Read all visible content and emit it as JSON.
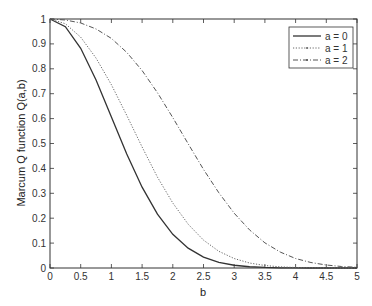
{
  "chart_data": {
    "type": "line",
    "title": "",
    "xlabel": "b",
    "ylabel": "Marcum Q function Q(a,b)",
    "xlim": [
      0,
      5
    ],
    "ylim": [
      0,
      1
    ],
    "grid": false,
    "legend_position": "upper right",
    "xticks": [
      "0",
      "0.5",
      "1",
      "1.5",
      "2",
      "2.5",
      "3",
      "3.5",
      "4",
      "4.5",
      "5"
    ],
    "yticks": [
      "0",
      "0.1",
      "0.2",
      "0.3",
      "0.4",
      "0.5",
      "0.6",
      "0.7",
      "0.8",
      "0.9",
      "1"
    ],
    "x": [
      0,
      0.25,
      0.5,
      0.75,
      1,
      1.25,
      1.5,
      1.75,
      2,
      2.25,
      2.5,
      2.75,
      3,
      3.25,
      3.5,
      3.75,
      4,
      4.25,
      4.5,
      4.75,
      5
    ],
    "series": [
      {
        "name": "a = 0",
        "style": "solid",
        "color": "#333333",
        "values": [
          1,
          0.969,
          0.8825,
          0.7548,
          0.6065,
          0.4578,
          0.3247,
          0.2163,
          0.1353,
          0.0796,
          0.0439,
          0.0228,
          0.0111,
          0.0051,
          0.0022,
          0.0009,
          0.0003,
          0.0001,
          4e-05,
          1e-05,
          0
        ]
      },
      {
        "name": "a = 1",
        "style": "dotted",
        "color": "#666666",
        "values": [
          1,
          0.981,
          0.927,
          0.843,
          0.736,
          0.613,
          0.486,
          0.365,
          0.261,
          0.176,
          0.112,
          0.067,
          0.038,
          0.02,
          0.01,
          0.0046,
          0.002,
          0.0008,
          0.0003,
          0.0001,
          3e-05
        ]
      },
      {
        "name": "a = 2",
        "style": "dashdot",
        "color": "#555555",
        "values": [
          1,
          0.996,
          0.984,
          0.96,
          0.922,
          0.866,
          0.793,
          0.704,
          0.604,
          0.499,
          0.396,
          0.302,
          0.22,
          0.153,
          0.101,
          0.064,
          0.038,
          0.022,
          0.012,
          0.006,
          0.003
        ]
      }
    ]
  }
}
